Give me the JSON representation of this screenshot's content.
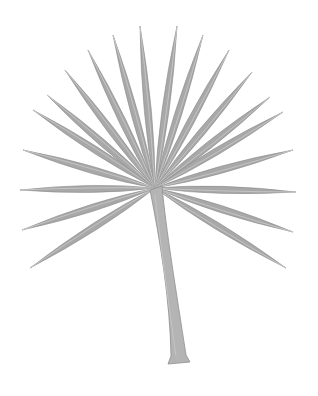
{
  "image": {
    "subject": "Fan palm leaf illustration",
    "colors": {
      "background": "#ffffff",
      "leaf_fill": "#a8a8a8",
      "leaf_dark": "#8a8a8a",
      "leaf_light": "#c4c4c4",
      "stem_fill": "#b4b4b4",
      "stem_edge": "#8e8e8e"
    },
    "center": [
      155,
      188
    ],
    "leaflet_tips": [
      [
        30,
        268
      ],
      [
        22,
        230
      ],
      [
        20,
        190
      ],
      [
        23,
        150
      ],
      [
        33,
        110
      ],
      [
        47,
        95
      ],
      [
        65,
        70
      ],
      [
        88,
        50
      ],
      [
        113,
        35
      ],
      [
        140,
        26
      ],
      [
        177,
        26
      ],
      [
        203,
        35
      ],
      [
        229,
        50
      ],
      [
        252,
        72
      ],
      [
        270,
        97
      ],
      [
        283,
        112
      ],
      [
        293,
        150
      ],
      [
        296,
        192
      ],
      [
        293,
        232
      ],
      [
        286,
        268
      ]
    ]
  }
}
